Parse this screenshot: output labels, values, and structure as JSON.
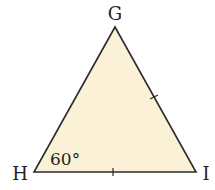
{
  "diagram": {
    "type": "triangle",
    "fill_color": "#fbf1d6",
    "stroke_color": "#2b2b2b",
    "vertices": [
      {
        "name": "G",
        "x": 115,
        "y": 27
      },
      {
        "name": "H",
        "x": 34,
        "y": 172
      },
      {
        "name": "I",
        "x": 196,
        "y": 172
      }
    ],
    "labels": {
      "G": "G",
      "H": "H",
      "I": "I",
      "angle_H": "60°"
    },
    "tick_marks": [
      {
        "side": "GI",
        "count": 1
      },
      {
        "side": "HI",
        "count": 1
      }
    ]
  }
}
